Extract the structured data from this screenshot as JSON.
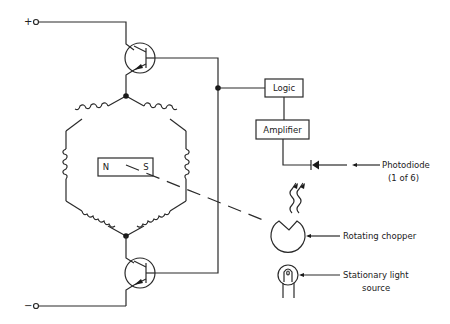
{
  "diagram": {
    "terminals": {
      "positive": "+",
      "negative": "−"
    },
    "magnet": {
      "north": "N",
      "south": "S"
    },
    "blocks": {
      "logic": "Logic",
      "amplifier": "Amplifier"
    },
    "callouts": {
      "photodiode_line1": "Photodiode",
      "photodiode_line2": "(1 of 6)",
      "chopper": "Rotating chopper",
      "light_line1": "Stationary light",
      "light_line2": "source"
    },
    "colors": {
      "line": "#2a2a2a",
      "background": "#ffffff"
    }
  }
}
